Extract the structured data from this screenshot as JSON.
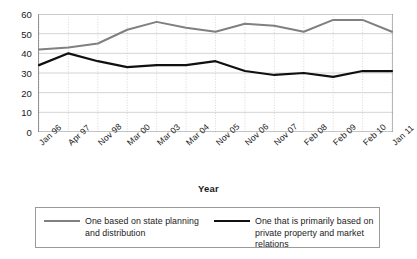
{
  "chart_data": {
    "type": "line",
    "title": "",
    "xlabel": "Year",
    "ylabel": "",
    "ylim": [
      0,
      60
    ],
    "yticks": [
      0,
      10,
      20,
      30,
      40,
      50,
      60
    ],
    "grid": true,
    "legend_position": "bottom",
    "categories": [
      "Jan 96",
      "Apr 97",
      "Nov 98",
      "Mar 00",
      "Mar 03",
      "Mar 04",
      "Nov 05",
      "Nov 06",
      "Nov 07",
      "Feb 08",
      "Feb 09",
      "Feb 10",
      "Jan 11"
    ],
    "series": [
      {
        "name": "One based on state planning and distribution",
        "color": "#808080",
        "values": [
          42,
          43,
          45,
          52,
          56,
          53,
          51,
          55,
          54,
          51,
          57,
          57,
          51
        ]
      },
      {
        "name": "One that is primarily based on private property and market relations",
        "color": "#101010",
        "values": [
          34,
          40,
          36,
          33,
          34,
          34,
          36,
          31,
          29,
          30,
          28,
          31,
          31
        ]
      }
    ]
  },
  "axis": {
    "x_title": "Year"
  },
  "legend": {
    "items": [
      {
        "label": "One based on state planning and distribution",
        "color": "#808080"
      },
      {
        "label": "One that is primarily based on private property and market relations",
        "color": "#101010"
      }
    ]
  },
  "caption": {
    "cut_off_text": ""
  },
  "colors": {
    "series_gray": "#808080",
    "series_black": "#101010",
    "axis": "#6e6e6e",
    "grid": "#c9c9c9",
    "background": "#ffffff"
  }
}
